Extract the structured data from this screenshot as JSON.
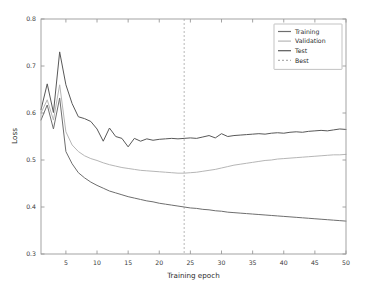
{
  "chart_data": {
    "type": "line",
    "title": "",
    "xlabel": "Training epoch",
    "ylabel": "Loss",
    "xlim": [
      1,
      50
    ],
    "ylim": [
      0.3,
      0.8
    ],
    "xticks": [
      5,
      10,
      15,
      20,
      25,
      30,
      35,
      40,
      45,
      50
    ],
    "xtick_labels": [
      "5",
      "10",
      "15",
      "20",
      "25",
      "30",
      "35",
      "40",
      "45",
      "50"
    ],
    "yticks": [
      0.3,
      0.4,
      0.5,
      0.6,
      0.7,
      0.8
    ],
    "ytick_labels": [
      "0.3",
      "0.4",
      "0.5",
      "0.6",
      "0.7",
      "0.8"
    ],
    "grid": false,
    "legend_position": "upper right",
    "legend_entries": [
      "Training",
      "Validation",
      "Test",
      "Best"
    ],
    "x": [
      1,
      2,
      3,
      4,
      5,
      6,
      7,
      8,
      9,
      10,
      11,
      12,
      13,
      14,
      15,
      16,
      17,
      18,
      19,
      20,
      21,
      22,
      23,
      24,
      25,
      26,
      27,
      28,
      29,
      30,
      31,
      32,
      33,
      34,
      35,
      36,
      37,
      38,
      39,
      40,
      41,
      42,
      43,
      44,
      45,
      46,
      47,
      48,
      49,
      50
    ],
    "series": [
      {
        "name": "Training",
        "color": "#6e6e6e",
        "style": "solid",
        "values": [
          0.585,
          0.617,
          0.566,
          0.632,
          0.518,
          0.492,
          0.473,
          0.462,
          0.453,
          0.446,
          0.44,
          0.434,
          0.43,
          0.426,
          0.422,
          0.419,
          0.416,
          0.413,
          0.411,
          0.408,
          0.406,
          0.404,
          0.402,
          0.4,
          0.398,
          0.397,
          0.395,
          0.394,
          0.392,
          0.391,
          0.389,
          0.388,
          0.387,
          0.386,
          0.385,
          0.384,
          0.383,
          0.382,
          0.381,
          0.38,
          0.379,
          0.378,
          0.377,
          0.376,
          0.375,
          0.374,
          0.373,
          0.372,
          0.371,
          0.37
        ]
      },
      {
        "name": "Validation",
        "color": "#b6b6b6",
        "style": "solid",
        "values": [
          0.6,
          0.628,
          0.585,
          0.66,
          0.56,
          0.532,
          0.518,
          0.509,
          0.503,
          0.499,
          0.494,
          0.49,
          0.487,
          0.484,
          0.482,
          0.48,
          0.478,
          0.477,
          0.476,
          0.475,
          0.474,
          0.473,
          0.472,
          0.472,
          0.473,
          0.474,
          0.476,
          0.478,
          0.48,
          0.483,
          0.486,
          0.489,
          0.491,
          0.493,
          0.495,
          0.497,
          0.499,
          0.5,
          0.502,
          0.503,
          0.504,
          0.505,
          0.506,
          0.507,
          0.508,
          0.509,
          0.51,
          0.511,
          0.511,
          0.512
        ]
      },
      {
        "name": "Test",
        "color": "#585858",
        "style": "solid",
        "values": [
          0.607,
          0.662,
          0.601,
          0.73,
          0.66,
          0.62,
          0.592,
          0.588,
          0.582,
          0.566,
          0.54,
          0.568,
          0.55,
          0.546,
          0.528,
          0.546,
          0.54,
          0.545,
          0.542,
          0.544,
          0.545,
          0.546,
          0.545,
          0.546,
          0.547,
          0.546,
          0.549,
          0.552,
          0.547,
          0.556,
          0.55,
          0.552,
          0.553,
          0.554,
          0.555,
          0.556,
          0.555,
          0.557,
          0.558,
          0.557,
          0.559,
          0.56,
          0.559,
          0.561,
          0.562,
          0.563,
          0.562,
          0.564,
          0.566,
          0.565
        ]
      }
    ],
    "annotations": [
      {
        "name": "Best",
        "type": "vline",
        "x": 24,
        "color": "#b0b0b0",
        "style": "dashed"
      }
    ]
  },
  "axes": {
    "ylabel_text": "Loss",
    "xlabel_text": "Training epoch"
  }
}
